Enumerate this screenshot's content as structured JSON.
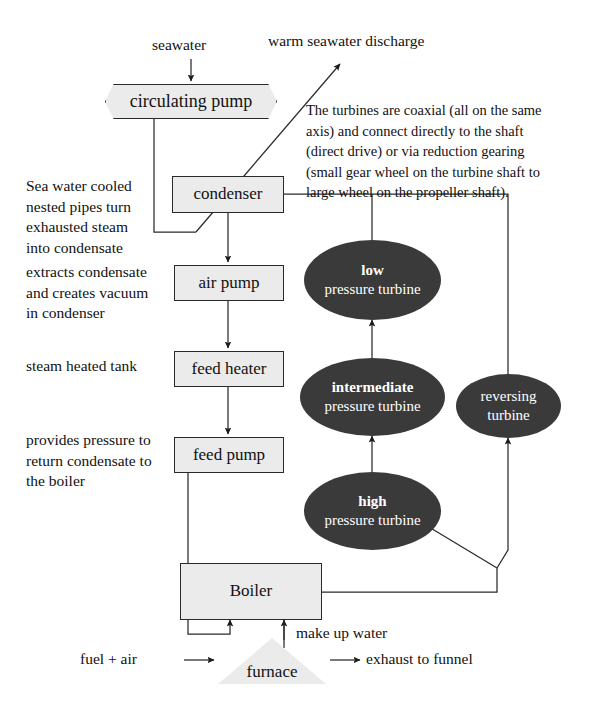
{
  "diagram": {
    "colors": {
      "box_fill": "#ebebeb",
      "turbine_fill": "#3a3a3a",
      "stroke": "#2a2a2a",
      "text": "#111111",
      "turbine_text": "#ffffff"
    },
    "inputs": {
      "seawater": "seawater",
      "fuel_air": "fuel + air"
    },
    "outputs": {
      "warm_discharge": "warm seawater discharge",
      "exhaust": "exhaust to funnel"
    },
    "flows": {
      "make_up_water": "make up water"
    },
    "nodes": {
      "circulating_pump": "circulating pump",
      "condenser": "condenser",
      "air_pump": "air pump",
      "feed_heater": "feed heater",
      "feed_pump": "feed pump",
      "boiler": "Boiler",
      "furnace": "furnace"
    },
    "turbines": [
      {
        "id": "low",
        "kind": "low",
        "suffix": "pressure turbine"
      },
      {
        "id": "intermediate",
        "kind": "intermediate",
        "suffix": "pressure turbine"
      },
      {
        "id": "high",
        "kind": "high",
        "suffix": "pressure turbine"
      },
      {
        "id": "reversing",
        "kind": "reversing",
        "suffix": "turbine"
      }
    ],
    "annotations": {
      "condenser_note": "Sea water cooled\nnested pipes turn\nexhausted steam\ninto condensate",
      "air_pump_note": "extracts condensate\nand creates vacuum\nin condenser",
      "feed_heater_note": "steam heated tank",
      "feed_pump_note": "provides pressure to\nreturn condensate to\nthe boiler",
      "turbine_note": "The turbines are coaxial (all on the same\naxis) and connect directly to the shaft\n(direct drive) or via reduction gearing\n(small gear wheel on the turbine shaft to\nlarge wheel on the propeller shaft)."
    }
  }
}
